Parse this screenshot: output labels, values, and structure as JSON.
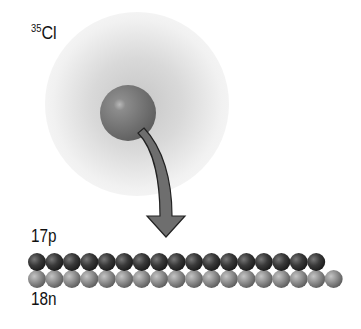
{
  "diagram": {
    "isotope": {
      "mass_number": "35",
      "symbol": "Cl"
    },
    "protons": {
      "label": "17p",
      "count": 17,
      "color": "#3a3a3a"
    },
    "neutrons": {
      "label": "18n",
      "count": 18,
      "color": "#8a8a8a"
    },
    "nucleus_color": "#7a7a7a",
    "arrow_color": "#6e6e6e"
  }
}
